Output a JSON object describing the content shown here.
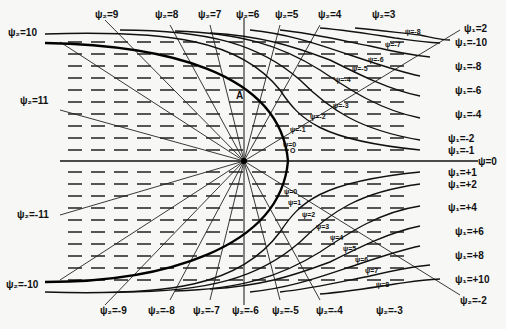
{
  "diagram": {
    "type": "flow-field-streamlines",
    "center_label": "O",
    "point_label": "A",
    "axis_label": "ψ=0",
    "top_labels": [
      "ψ₂=10",
      "ψ₂=9",
      "ψ₂=8",
      "ψ₂=7",
      "ψ₂=6",
      "ψ₂=5",
      "ψ₂=4",
      "ψ₂=3"
    ],
    "left_labels": [
      "ψ₂=11",
      "ψ₂=-11",
      "ψ₂=-10"
    ],
    "bottom_labels": [
      "ψ₂=-9",
      "ψ₂=-8",
      "ψ₂=-7",
      "ψ₂=-6",
      "ψ₂=-5",
      "ψ₂=-4",
      "ψ₂=-3"
    ],
    "right_labels": [
      "ψ₁=2",
      "ψ₁=-10",
      "ψ₁=-8",
      "ψ₁=-6",
      "ψ₁=-4",
      "ψ₁=-2",
      "ψ₁=-1",
      "ψ=0",
      "ψ₁=+1",
      "ψ₁=+2",
      "ψ₁=+4",
      "ψ₁=+6",
      "ψ₁=+8",
      "ψ₁=+10",
      "ψ₂=-2"
    ],
    "upper_streamlines": [
      "ψ=-8",
      "ψ=-7",
      "ψ=-6",
      "ψ=-5",
      "ψ=-4",
      "ψ=-3",
      "ψ=-2",
      "ψ=-1",
      "ψ=0"
    ],
    "lower_streamlines": [
      "ψ=0",
      "ψ=1",
      "ψ=2",
      "ψ=3",
      "ψ=4",
      "ψ=5",
      "ψ=6",
      "ψ=7",
      "ψ=8"
    ],
    "colors": {
      "ink": "#111111",
      "paper": "#f7f7f5"
    }
  }
}
